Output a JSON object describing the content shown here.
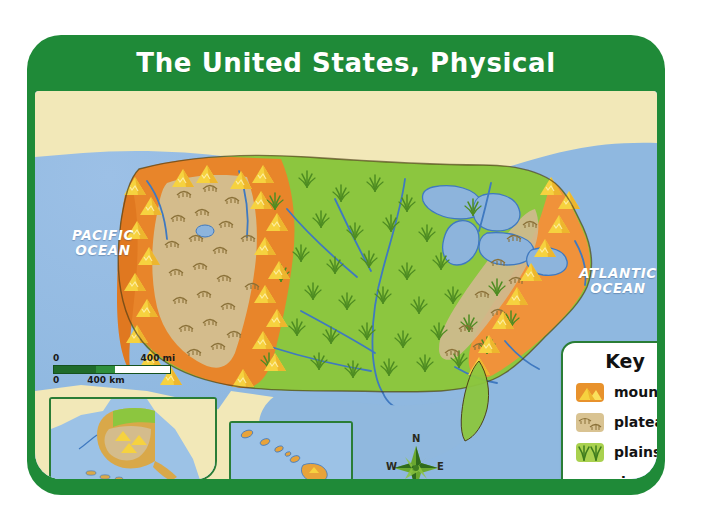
{
  "map": {
    "title": "The United States, Physical",
    "frame_color": "#1f8a38",
    "ocean_color": "#8fb8e0",
    "land_neighbor_color": "#f2e8b8",
    "labels": {
      "pacific_ocean": "PACIFIC\nOCEAN",
      "pacific_ocean_line1": "PACIFIC",
      "pacific_ocean_line2": "OCEAN",
      "atlantic_ocean_line1": "ATLANTIC",
      "atlantic_ocean_line2": "OCEAN"
    },
    "scale": {
      "miles_zero": "0",
      "miles_max": "400 mi",
      "km_zero": "0",
      "km_max": "400 km"
    },
    "compass": {
      "north": "N",
      "south": "S",
      "east": "E",
      "west": "W"
    },
    "insets": [
      {
        "name": "alaska-inset"
      },
      {
        "name": "hawaii-inset"
      }
    ]
  },
  "key": {
    "title": "Key",
    "items": [
      {
        "label": "mountains",
        "color": "#e8922c",
        "icon": "mountain-peaks-icon"
      },
      {
        "label": "plateaus",
        "color": "#d9c392",
        "icon": "plateau-lines-icon"
      },
      {
        "label": "plains",
        "color": "#a9d14f",
        "icon": "grass-tufts-icon"
      },
      {
        "label": "rivers",
        "color": "#4f86c6",
        "icon": "wavy-line-icon"
      }
    ]
  }
}
